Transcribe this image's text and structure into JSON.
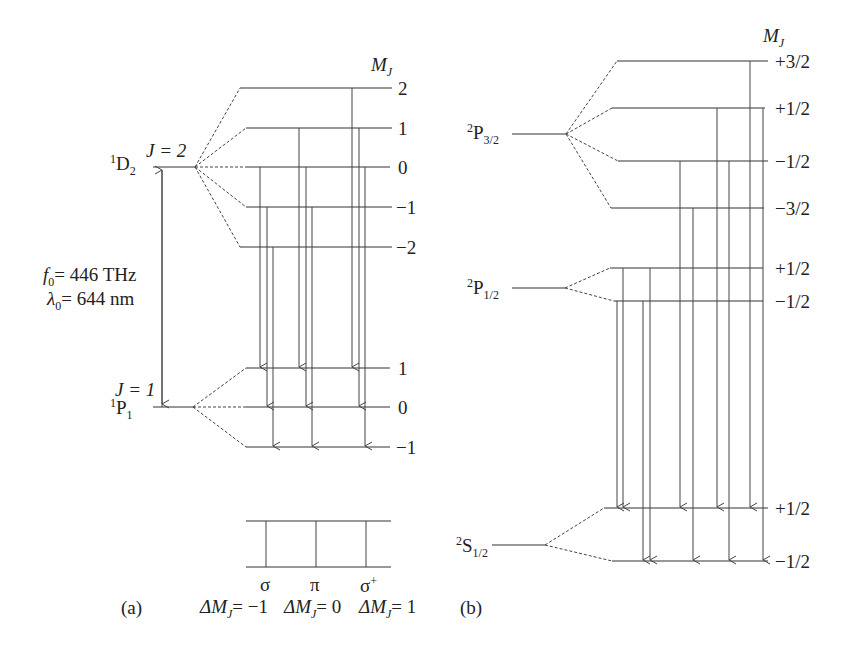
{
  "panel_a": {
    "caption": "(a)",
    "mj_header": "M",
    "mj_header_sub": "J",
    "upper_term": {
      "sup": "1",
      "base": "D",
      "sub": "2"
    },
    "upper_j": "J = 2",
    "lower_term": {
      "sup": "1",
      "base": "P",
      "sub": "1"
    },
    "lower_j": "J = 1",
    "frequency": {
      "symbol": "f",
      "sub": "0",
      "text": "= 446 THz"
    },
    "wavelength": {
      "symbol": "λ",
      "sub": "0",
      "text": "= 644 nm"
    },
    "upper_mj_labels": [
      "2",
      "1",
      "0",
      "−1",
      "−2"
    ],
    "lower_mj_labels": [
      "1",
      "0",
      "−1"
    ],
    "legend": {
      "sigma_minus": {
        "symbol": "σ",
        "rule": "ΔM",
        "rule_sub": "J",
        "rule_val": "= −1"
      },
      "pi": {
        "symbol": "π",
        "rule": "ΔM",
        "rule_sub": "J",
        "rule_val": "= 0"
      },
      "sigma_plus": {
        "symbol": "σ",
        "symbol_sup": "+",
        "rule": "ΔM",
        "rule_sub": "J",
        "rule_val": "= 1"
      }
    }
  },
  "panel_b": {
    "caption": "(b)",
    "mj_header": "M",
    "mj_header_sub": "J",
    "p32_term": {
      "sup": "2",
      "base": "P",
      "sub": "3/2"
    },
    "p12_term": {
      "sup": "2",
      "base": "P",
      "sub": "1/2"
    },
    "s12_term": {
      "sup": "2",
      "base": "S",
      "sub": "1/2"
    },
    "p32_mj_labels": [
      "+3/2",
      "+1/2",
      "−1/2",
      "−3/2"
    ],
    "p12_mj_labels": [
      "+1/2",
      "−1/2"
    ],
    "s12_mj_labels": [
      "+1/2",
      "−1/2"
    ]
  },
  "colors": {
    "line": "#333333",
    "background": "#ffffff"
  }
}
